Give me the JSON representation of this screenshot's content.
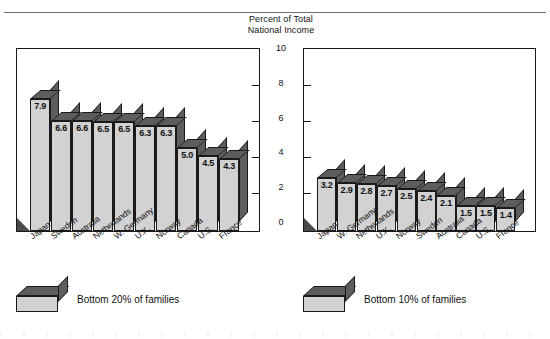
{
  "figure": {
    "axis_title_line1": "Percent of Total",
    "axis_title_line2": "National Income",
    "y_ticks": [
      "10",
      "8",
      "6",
      "4",
      "2",
      "0"
    ]
  },
  "legends": {
    "left": "Bottom 20% of families",
    "right": "Bottom 10% of families"
  },
  "chart_data": [
    {
      "type": "bar",
      "title": "Percent of Total National Income",
      "subtitle": "Bottom 20% of families",
      "xlabel": "",
      "ylabel": "Percent of Total National Income",
      "ylim": [
        0,
        10
      ],
      "yticks": [
        0,
        2,
        4,
        6,
        8,
        10
      ],
      "grid": false,
      "legend": "Bottom 20% of families",
      "legend_position": "below-left",
      "categories": [
        "Japan",
        "Sweden",
        "Australia",
        "Netherlands",
        "W. Germany",
        "U.K.",
        "Norway",
        "Canada",
        "U.S.",
        "France"
      ],
      "values": [
        7.9,
        6.6,
        6.6,
        6.5,
        6.5,
        6.3,
        6.3,
        5.0,
        4.5,
        4.3
      ],
      "labels": [
        "7.9",
        "6.6",
        "6.6",
        "6.5",
        "6.5",
        "6.3",
        "6.3",
        "5.0",
        "4.5",
        "4.3"
      ]
    },
    {
      "type": "bar",
      "title": "Percent of Total National Income",
      "subtitle": "Bottom 10% of families",
      "xlabel": "",
      "ylabel": "Percent of Total National Income",
      "ylim": [
        0,
        10
      ],
      "yticks": [
        0,
        2,
        4,
        6,
        8,
        10
      ],
      "grid": false,
      "legend": "Bottom 10% of families",
      "legend_position": "below-left",
      "categories": [
        "Japan",
        "W. Germany",
        "Netherlands",
        "U.K.",
        "Norway",
        "Sweden",
        "Australia",
        "Canada",
        "U.S.",
        "France"
      ],
      "values": [
        3.2,
        2.9,
        2.8,
        2.7,
        2.5,
        2.4,
        2.1,
        1.5,
        1.5,
        1.4
      ],
      "labels": [
        "3.2",
        "2.9",
        "2.8",
        "2.7",
        "2.5",
        "2.4",
        "2.1",
        "1.5",
        "1.5",
        "1.4"
      ]
    }
  ]
}
